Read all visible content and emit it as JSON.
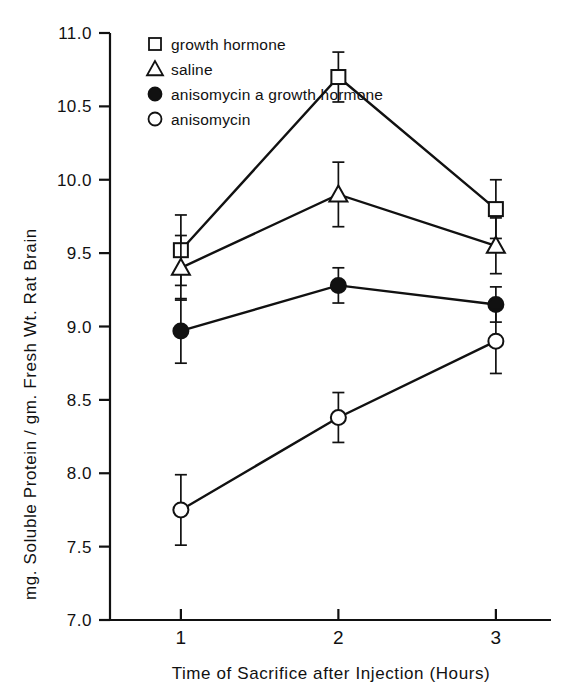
{
  "chart_data": {
    "type": "line",
    "title": "",
    "xlabel": "Time of Sacrifice after Injection (Hours)",
    "ylabel": "mg. Soluble Protein / gm. Fresh Wt. Rat Brain",
    "x": [
      1,
      2,
      3
    ],
    "xticklabels": [
      "1",
      "2",
      "3"
    ],
    "xlim": [
      0.55,
      3.35
    ],
    "ylim": [
      7.0,
      11.0
    ],
    "yticks": [
      7.0,
      7.5,
      8.0,
      8.5,
      9.0,
      9.5,
      10.0,
      10.5,
      11.0
    ],
    "yticklabels": [
      "7.0",
      "7.5",
      "8.0",
      "8.5",
      "9.0",
      "9.5",
      "10.0",
      "10.5",
      "11.0"
    ],
    "grid": false,
    "legend_position": "upper-left-inside",
    "series": [
      {
        "name": "growth hormone",
        "marker": "open-square",
        "values": [
          9.52,
          10.7,
          9.8
        ],
        "errors": [
          0.24,
          0.17,
          0.2
        ]
      },
      {
        "name": "saline",
        "marker": "open-triangle",
        "values": [
          9.4,
          9.9,
          9.55
        ],
        "errors": [
          0.22,
          0.22,
          0.19
        ]
      },
      {
        "name": "anisomycin a growth hormone",
        "marker": "filled-circle",
        "values": [
          8.97,
          9.28,
          9.15
        ],
        "errors": [
          0.22,
          0.12,
          0.12
        ]
      },
      {
        "name": "anisomycin",
        "marker": "open-circle",
        "values": [
          7.75,
          8.38,
          8.9
        ],
        "errors": [
          0.24,
          0.17,
          0.22
        ]
      }
    ]
  },
  "legend": {
    "items": [
      {
        "label": "growth hormone",
        "marker": "open-square"
      },
      {
        "label": "saline",
        "marker": "open-triangle"
      },
      {
        "label": "anisomycin a growth hormone",
        "marker": "filled-circle"
      },
      {
        "label": "anisomycin",
        "marker": "open-circle"
      }
    ]
  },
  "axes": {
    "y_title": "mg. Soluble Protein / gm. Fresh Wt. Rat Brain",
    "x_title": "Time of Sacrifice after Injection (Hours)"
  },
  "colors": {
    "ink": "#111111",
    "background": "#ffffff"
  }
}
